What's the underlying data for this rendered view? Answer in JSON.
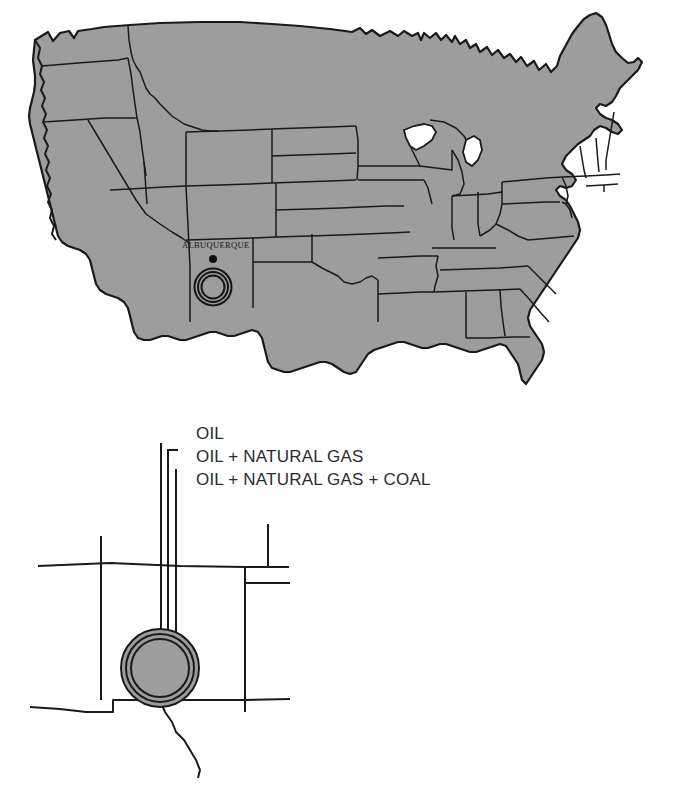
{
  "figure": {
    "kind": "map-figure",
    "background_color": "#ffffff",
    "land_fill": "#9d9d9d",
    "outline_color": "#1a1a1a",
    "text_color": "#2b2b2b"
  },
  "main_map": {
    "name": "contiguous-united-states",
    "city_marker": {
      "label": "ALBUQUERQUE",
      "dot_color": "#111111",
      "ring_count": 3
    }
  },
  "legend": {
    "items": [
      {
        "label": "OIL"
      },
      {
        "label": "OIL + NATURAL GAS"
      },
      {
        "label": "OIL + NATURAL GAS + COAL"
      }
    ]
  },
  "inset_map": {
    "name": "new-mexico-detail",
    "ring_count": 3,
    "ring_fill": "#9d9d9d"
  }
}
